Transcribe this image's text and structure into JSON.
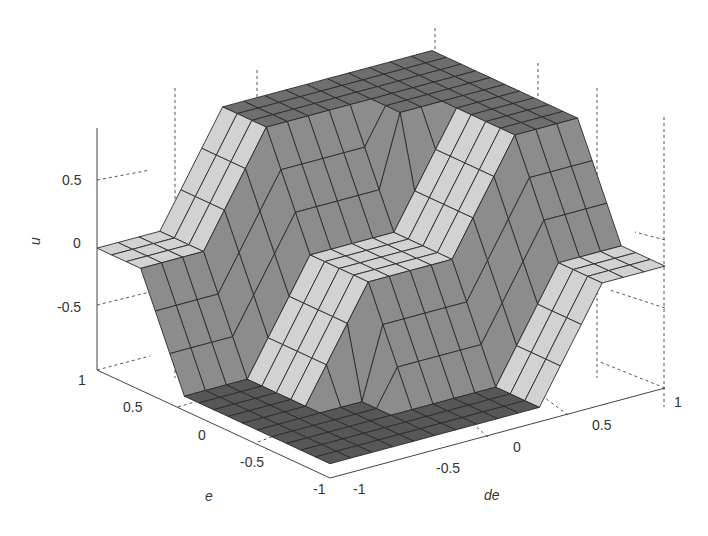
{
  "chart_data": {
    "type": "surface3d",
    "title": "",
    "xlabel": "de",
    "ylabel": "e",
    "zlabel": "u",
    "xlim": [
      -1,
      1
    ],
    "ylim": [
      -1,
      1
    ],
    "zlim": [
      -0.85,
      0.85
    ],
    "x_ticks": [
      "-1",
      "-0.5",
      "0",
      "0.5",
      "1"
    ],
    "y_ticks": [
      "-1",
      "-0.5",
      "0",
      "0.5",
      "1"
    ],
    "z_ticks": [
      "-0.5",
      "0",
      "0.5"
    ],
    "grid": true,
    "grid_style": "dashed",
    "shading": "faceted",
    "colormap": "gray",
    "grid_n": 17,
    "x": [
      -1,
      -0.875,
      -0.75,
      -0.625,
      -0.5,
      -0.375,
      -0.25,
      -0.125,
      0,
      0.125,
      0.25,
      0.375,
      0.5,
      0.625,
      0.75,
      0.875,
      1
    ],
    "y": [
      -1,
      -0.875,
      -0.75,
      -0.625,
      -0.5,
      -0.375,
      -0.25,
      -0.125,
      0,
      0.125,
      0.25,
      0.375,
      0.5,
      0.625,
      0.75,
      0.875,
      1
    ],
    "plateau_levels": [
      -0.75,
      0,
      0.75
    ]
  },
  "axes": {
    "z_tick_labels": [
      "0.5",
      "0",
      "-0.5"
    ],
    "e_tick_labels": [
      "1",
      "0.5",
      "0",
      "-0.5",
      "-1"
    ],
    "de_tick_labels": [
      "-1",
      "-0.5",
      "0",
      "0.5",
      "1"
    ],
    "e_label": "e",
    "de_label": "de",
    "u_label": "u"
  },
  "colors": {
    "face_light": "#d2d2d2",
    "face_mid": "#8c8c8c",
    "face_dark": "#6e6e6e",
    "face_darkest": "#575757",
    "edge": "#2a2a2a",
    "axis": "#444444",
    "grid": "#555555"
  }
}
